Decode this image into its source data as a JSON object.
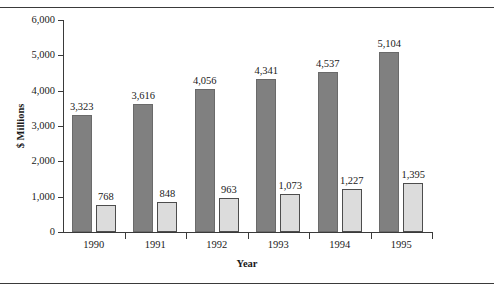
{
  "chart_data": {
    "type": "bar",
    "title": "",
    "subtitle": "",
    "xlabel": "Year",
    "ylabel": "$ Millions",
    "categories": [
      "1990",
      "1991",
      "1992",
      "1993",
      "1994",
      "1995"
    ],
    "series": [
      {
        "name": "series-1",
        "color": "#808080",
        "values": [
          3323,
          3616,
          4056,
          4341,
          4537,
          5104
        ],
        "labels": [
          "3,323",
          "3,616",
          "4,056",
          "4,341",
          "4,537",
          "5,104"
        ]
      },
      {
        "name": "series-2",
        "color": "#dcdcdc",
        "values": [
          768,
          848,
          963,
          1073,
          1227,
          1395
        ],
        "labels": [
          "768",
          "848",
          "963",
          "1,073",
          "1,227",
          "1,395"
        ]
      }
    ],
    "ylim": [
      0,
      6000
    ],
    "yticks": [
      0,
      1000,
      2000,
      3000,
      4000,
      5000,
      6000
    ],
    "ytick_labels": [
      "0",
      "1,000",
      "2,000",
      "3,000",
      "4,000",
      "5,000",
      "6,000"
    ],
    "grid": false,
    "legend": "none",
    "border_color": "#3a3a3a",
    "background": "#ffffff"
  }
}
